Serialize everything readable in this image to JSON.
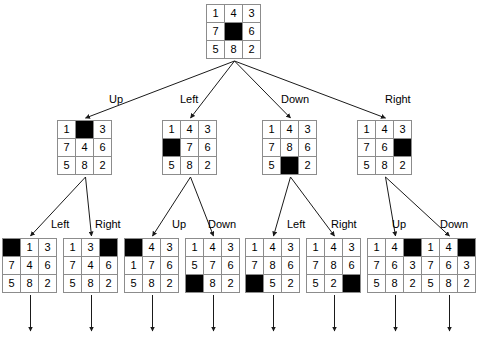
{
  "diagram": {
    "blank_cell_color": "#000000",
    "cell_border_color": "#8c8c8c",
    "background_color": "#ffffff",
    "edge_color": "#1a1a1a",
    "blank_symbol": "",
    "root": {
      "id": "root",
      "grid": [
        [
          "1",
          "4",
          "3"
        ],
        [
          "7",
          "",
          "6"
        ],
        [
          "5",
          "8",
          "2"
        ]
      ],
      "blank": [
        1,
        1
      ],
      "x": 206,
      "y": 4
    },
    "level2": [
      {
        "id": "n-up",
        "label": "Up",
        "grid": [
          [
            "1",
            "",
            "3"
          ],
          [
            "7",
            "4",
            "6"
          ],
          [
            "5",
            "8",
            "2"
          ]
        ],
        "blank": [
          0,
          1
        ],
        "x": 57,
        "y": 120,
        "label_x": 109,
        "label_y": 93
      },
      {
        "id": "n-left",
        "label": "Left",
        "grid": [
          [
            "1",
            "4",
            "3"
          ],
          [
            "",
            "7",
            "6"
          ],
          [
            "5",
            "8",
            "2"
          ]
        ],
        "blank": [
          1,
          0
        ],
        "x": 162,
        "y": 120,
        "label_x": 180,
        "label_y": 93
      },
      {
        "id": "n-down",
        "label": "Down",
        "grid": [
          [
            "1",
            "4",
            "3"
          ],
          [
            "7",
            "8",
            "6"
          ],
          [
            "5",
            "",
            "2"
          ]
        ],
        "blank": [
          2,
          1
        ],
        "x": 262,
        "y": 120,
        "label_x": 281,
        "label_y": 93
      },
      {
        "id": "n-right",
        "label": "Right",
        "grid": [
          [
            "1",
            "4",
            "3"
          ],
          [
            "7",
            "6",
            ""
          ],
          [
            "5",
            "8",
            "2"
          ]
        ],
        "blank": [
          1,
          2
        ],
        "x": 357,
        "y": 120,
        "label_x": 385,
        "label_y": 93
      }
    ],
    "level3": [
      {
        "id": "n-up-left",
        "label": "Left",
        "parent": "n-up",
        "grid": [
          [
            "",
            "1",
            "3"
          ],
          [
            "7",
            "4",
            "6"
          ],
          [
            "5",
            "8",
            "2"
          ]
        ],
        "blank": [
          0,
          0
        ],
        "x": 2,
        "y": 238,
        "label_x": 51,
        "label_y": 218
      },
      {
        "id": "n-up-right",
        "label": "Right",
        "parent": "n-up",
        "grid": [
          [
            "1",
            "3",
            ""
          ],
          [
            "7",
            "4",
            "6"
          ],
          [
            "5",
            "8",
            "2"
          ]
        ],
        "blank": [
          0,
          2
        ],
        "x": 63,
        "y": 238,
        "label_x": 95,
        "label_y": 218
      },
      {
        "id": "n-left-up",
        "label": "Up",
        "parent": "n-left",
        "grid": [
          [
            "",
            "4",
            "3"
          ],
          [
            "1",
            "7",
            "6"
          ],
          [
            "5",
            "8",
            "2"
          ]
        ],
        "blank": [
          0,
          0
        ],
        "x": 124,
        "y": 238,
        "label_x": 172,
        "label_y": 218
      },
      {
        "id": "n-left-down",
        "label": "Down",
        "parent": "n-left",
        "grid": [
          [
            "1",
            "4",
            "3"
          ],
          [
            "5",
            "7",
            "6"
          ],
          [
            "",
            "8",
            "2"
          ]
        ],
        "blank": [
          2,
          0
        ],
        "x": 185,
        "y": 238,
        "label_x": 208,
        "label_y": 218
      },
      {
        "id": "n-down-left",
        "label": "Left",
        "parent": "n-down",
        "grid": [
          [
            "1",
            "4",
            "3"
          ],
          [
            "7",
            "8",
            "6"
          ],
          [
            "",
            "5",
            "2"
          ]
        ],
        "blank": [
          2,
          0
        ],
        "x": 245,
        "y": 238,
        "label_x": 287,
        "label_y": 218
      },
      {
        "id": "n-down-right",
        "label": "Right",
        "parent": "n-down",
        "grid": [
          [
            "1",
            "4",
            "3"
          ],
          [
            "7",
            "8",
            "6"
          ],
          [
            "5",
            "2",
            ""
          ]
        ],
        "blank": [
          2,
          2
        ],
        "x": 306,
        "y": 238,
        "label_x": 331,
        "label_y": 218
      },
      {
        "id": "n-right-up",
        "label": "Up",
        "parent": "n-right",
        "grid": [
          [
            "1",
            "4",
            ""
          ],
          [
            "7",
            "6",
            "3"
          ],
          [
            "5",
            "8",
            "2"
          ]
        ],
        "blank": [
          0,
          2
        ],
        "x": 367,
        "y": 238,
        "label_x": 392,
        "label_y": 218
      },
      {
        "id": "n-right-down",
        "label": "Down",
        "parent": "n-right",
        "grid": [
          [
            "1",
            "4",
            ""
          ],
          [
            "7",
            "6",
            "3"
          ],
          [
            "5",
            "8",
            "2"
          ]
        ],
        "blank": [
          0,
          2
        ],
        "x": 421,
        "y": 238,
        "label_x": 440,
        "label_y": 218
      }
    ]
  }
}
